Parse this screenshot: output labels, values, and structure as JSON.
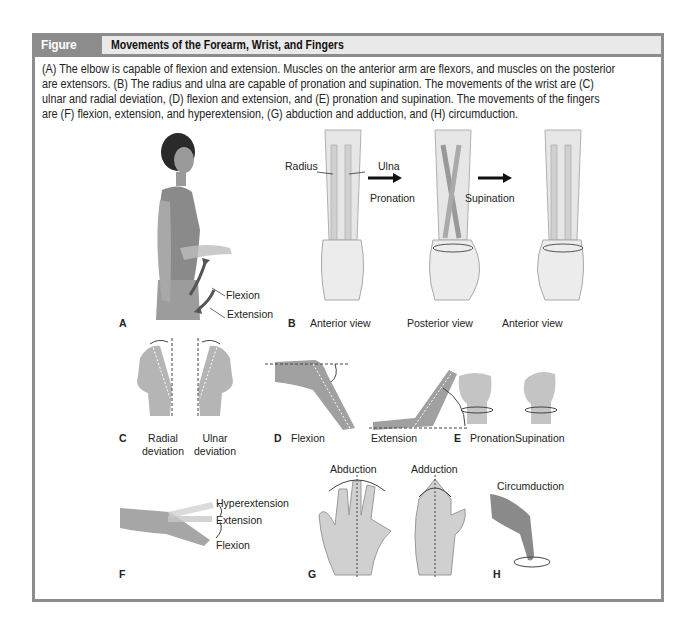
{
  "figure": {
    "number": "Figure 14.7",
    "title": "Movements of the Forearm, Wrist, and Fingers",
    "caption": "(A) The elbow is capable of flexion and extension. Muscles on the anterior arm are flexors, and muscles on the posterior are extensors. (B) The radius and ulna are capable of pronation and supination. The movements of the wrist are (C) ulnar and radial deviation, (D) flexion and extension, and (E) pronation and supination. The movements of the fingers are (F) flexion, extension, and hyperextension, (G) abduction and adduction, and (H) circumduction.",
    "colors": {
      "frame": "#8c8c8c",
      "header_bg": "#e9e9e9",
      "skin": "#c9c9c9",
      "bone": "#e2e2e2"
    }
  },
  "panels": {
    "A": {
      "letter": "A",
      "labels": {
        "flexion": "Flexion",
        "extension": "Extension"
      },
      "icon": "elbow-flexion-figure"
    },
    "B": {
      "letter": "B",
      "labels": {
        "radius": "Radius",
        "ulna": "Ulna",
        "pronation": "Pronation",
        "supination": "Supination"
      },
      "views": [
        "Anterior view",
        "Posterior view",
        "Anterior view"
      ],
      "icon": "forearm-bones"
    },
    "C": {
      "letter": "C",
      "labels": {
        "radial_1": "Radial",
        "radial_2": "deviation",
        "ulnar_1": "Ulnar",
        "ulnar_2": "deviation"
      },
      "icon": "wrist-deviation-hands"
    },
    "D": {
      "letter": "D",
      "labels": {
        "flexion": "Flexion",
        "extension": "Extension"
      },
      "icon": "wrist-flexion-extension"
    },
    "E": {
      "letter": "E",
      "labels": {
        "pronation": "Pronation",
        "supination": "Supination"
      },
      "icon": "fist-rotation"
    },
    "F": {
      "letter": "F",
      "labels": {
        "hyperextension": "Hyperextension",
        "extension": "Extension",
        "flexion": "Flexion"
      },
      "icon": "finger-flexion"
    },
    "G": {
      "letter": "G",
      "labels": {
        "abduction": "Abduction",
        "adduction": "Adduction"
      },
      "icon": "finger-abduction-hands"
    },
    "H": {
      "letter": "H",
      "labels": {
        "circumduction": "Circumduction"
      },
      "icon": "finger-circumduction"
    }
  }
}
